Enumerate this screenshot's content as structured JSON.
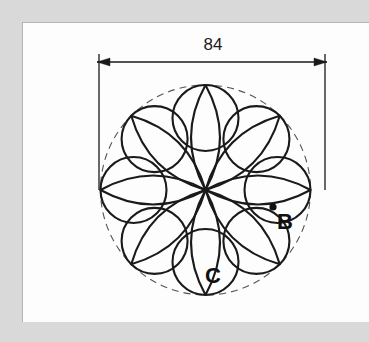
{
  "figure": {
    "dimension": {
      "value": "84",
      "units_implied": "mm",
      "orientation": "horizontal",
      "arrow_style": "outward-filled"
    },
    "labels": [
      {
        "id": "point-b",
        "text": "B",
        "x": 285,
        "y": 229
      },
      {
        "id": "point-c",
        "text": "C",
        "x": 213,
        "y": 283
      }
    ],
    "markers": [
      {
        "id": "point-b-dot",
        "x": 273,
        "y": 207,
        "r": 3.6,
        "fill": "#111111"
      }
    ],
    "colors": {
      "stroke": "#1a1a1a",
      "construction": "#555555",
      "page_background": "#d9d9d9",
      "panel_background": "#fdfdfd",
      "panel_border": "#b4b4b4"
    },
    "geometry": {
      "center": {
        "x": 205.5,
        "y": 190
      },
      "outer_circle_radius": 105,
      "petal_count": 8,
      "petal_length": 105,
      "petal_half_width": 29,
      "circle_count": 8,
      "small_circle_radius": 33,
      "small_circle_center_radius": 72,
      "petal_start_angle_deg": -90,
      "circle_start_angle_deg": -90
    },
    "dimension_line": {
      "y": 62,
      "x1": 97,
      "x2": 327,
      "ext_left_x": 99,
      "ext_right_x": 325,
      "ext_top_y": 54,
      "ext_bottom_y": 190,
      "text_x": 213,
      "text_y": 50
    }
  }
}
